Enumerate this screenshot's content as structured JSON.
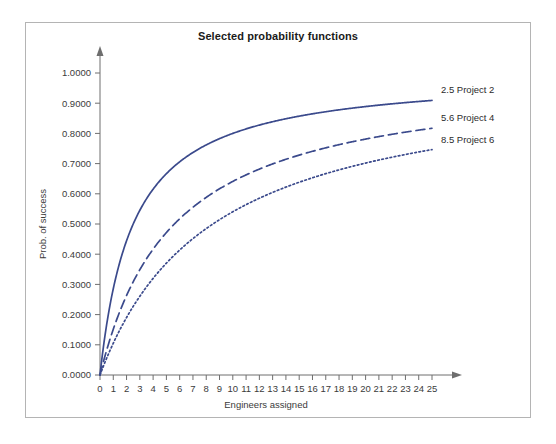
{
  "figure": {
    "title": "Selected probability functions",
    "frame_color": "#b4b4b4",
    "background": "#ffffff"
  },
  "chart_data": {
    "type": "line",
    "title": "Selected probability functions",
    "xlabel": "Engineers assigned",
    "ylabel": "Prob. of success",
    "xlim": [
      0,
      25
    ],
    "ylim": [
      0,
      1.0
    ],
    "grid": false,
    "legend_position": "right-inline-end-of-line",
    "accent_color": "#3b4a8c",
    "xticks": [
      0,
      1,
      2,
      3,
      4,
      5,
      6,
      7,
      8,
      9,
      10,
      11,
      12,
      13,
      14,
      15,
      16,
      17,
      18,
      19,
      20,
      21,
      22,
      23,
      24,
      25
    ],
    "xtick_labels": [
      "0",
      "1",
      "2",
      "3",
      "4",
      "5",
      "6",
      "7",
      "8",
      "9",
      "10",
      "11",
      "12",
      "13",
      "14",
      "15",
      "16",
      "17",
      "18",
      "19",
      "20",
      "21",
      "22",
      "23",
      "24",
      "25"
    ],
    "yticks": [
      0.0,
      0.1,
      0.2,
      0.3,
      0.4,
      0.5,
      0.6,
      0.7,
      0.8,
      0.9,
      1.0
    ],
    "ytick_labels": [
      "0.0000",
      "0.1000",
      "0.2000",
      "0.3000",
      "0.4000",
      "0.5000",
      "0.6000",
      "0.7000",
      "0.8000",
      "0.9000",
      "1.0000"
    ],
    "x": [
      0,
      1,
      2,
      3,
      4,
      5,
      6,
      7,
      8,
      9,
      10,
      11,
      12,
      13,
      14,
      15,
      16,
      17,
      18,
      19,
      20,
      21,
      22,
      23,
      24,
      25
    ],
    "series": [
      {
        "name": "2.5 Project 2",
        "label": "2.5 Project 2",
        "k": 2.5,
        "style": "solid",
        "color": "#3b4a8c",
        "values": [
          0.0,
          0.2857,
          0.4444,
          0.5455,
          0.6154,
          0.6667,
          0.7059,
          0.7368,
          0.7619,
          0.7826,
          0.8,
          0.8148,
          0.8276,
          0.8387,
          0.8485,
          0.8571,
          0.8649,
          0.8718,
          0.878,
          0.8837,
          0.8889,
          0.8936,
          0.898,
          0.902,
          0.9057,
          0.9091
        ]
      },
      {
        "name": "5.6 Project 4",
        "label": "5.6 Project 4",
        "k": 5.6,
        "style": "dashed",
        "color": "#3b4a8c",
        "values": [
          0.0,
          0.1515,
          0.2632,
          0.3488,
          0.4167,
          0.4717,
          0.5172,
          0.5556,
          0.5882,
          0.6164,
          0.641,
          0.6627,
          0.6818,
          0.699,
          0.7143,
          0.7282,
          0.7407,
          0.7522,
          0.7627,
          0.7724,
          0.7812,
          0.7895,
          0.7971,
          0.8042,
          0.8108,
          0.817
        ]
      },
      {
        "name": "8.5 Project 6",
        "label": "8.5 Project 6",
        "k": 8.5,
        "style": "dotted",
        "color": "#3b4a8c",
        "values": [
          0.0,
          0.1053,
          0.1905,
          0.2609,
          0.32,
          0.3704,
          0.4138,
          0.4516,
          0.4848,
          0.5143,
          0.5405,
          0.5641,
          0.5854,
          0.6047,
          0.6222,
          0.6383,
          0.6531,
          0.6667,
          0.6792,
          0.6909,
          0.7018,
          0.7119,
          0.7213,
          0.7302,
          0.7385,
          0.7463
        ]
      }
    ]
  }
}
